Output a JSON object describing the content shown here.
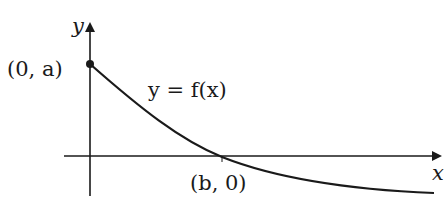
{
  "diagram": {
    "type": "function-graph",
    "axes": {
      "x_label": "x",
      "y_label": "y"
    },
    "curve_label": "y = f(x)",
    "points": [
      {
        "label": "(0, a)",
        "role": "y-intercept"
      },
      {
        "label": "(b, 0)",
        "role": "x-intercept"
      }
    ],
    "colors": {
      "stroke": "#1a1a1a",
      "background": "#ffffff"
    }
  }
}
